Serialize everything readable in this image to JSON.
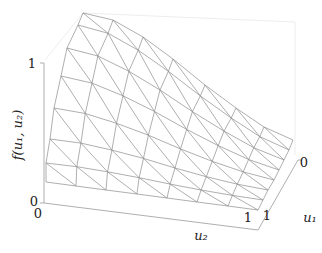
{
  "chart_data": {
    "type": "surface3d",
    "title": "",
    "zlabel": "f(u1, u2)",
    "xlabel": "u2",
    "ylabel": "u1",
    "z_ticks": [
      "0",
      "1"
    ],
    "u2_ticks": [
      "0",
      "1"
    ],
    "u1_ticks": [
      "0",
      "1"
    ],
    "zlim": [
      0,
      1
    ],
    "u1_range": [
      0,
      1
    ],
    "u2_range": [
      0,
      1
    ],
    "grid": {
      "rows": 7,
      "cols": 7,
      "triangulated": true,
      "diagonal": "top-left to bottom-right"
    },
    "mesh_color": "#8c8c8c",
    "frame_color": "#e6e6e6",
    "axis_color": "#999999",
    "projection": {
      "top_edge": [
        [
          83,
          13
        ],
        [
          113,
          20
        ],
        [
          143,
          37
        ],
        [
          173,
          59
        ],
        [
          205,
          85
        ],
        [
          236,
          108
        ],
        [
          264,
          127
        ],
        [
          293,
          140
        ]
      ],
      "bottom_edge": [
        [
          46,
          182
        ],
        [
          76,
          186
        ],
        [
          106,
          190
        ],
        [
          137,
          194
        ],
        [
          167,
          198
        ],
        [
          197,
          202
        ],
        [
          228,
          206
        ],
        [
          258,
          210
        ]
      ],
      "left_edge": [
        [
          83,
          13
        ],
        [
          78,
          25
        ],
        [
          67,
          48
        ],
        [
          61,
          76
        ],
        [
          54,
          108
        ],
        [
          50,
          139
        ],
        [
          46,
          163
        ],
        [
          46,
          182
        ]
      ],
      "right_edge": [
        [
          293,
          140
        ],
        [
          289,
          150
        ],
        [
          284,
          160
        ],
        [
          279,
          170
        ],
        [
          274,
          180
        ],
        [
          268,
          190
        ],
        [
          263,
          200
        ],
        [
          258,
          210
        ]
      ]
    }
  },
  "labels": {
    "z_axis": "f(u₁, u₂)",
    "z_tick_top": "1",
    "z_tick_bottom": "0",
    "u2_tick_left": "0",
    "u2_tick_right": "1",
    "u1_tick_back": "0",
    "u1_tick_front": "1",
    "u2_axis": "u₂",
    "u1_axis": "u₁"
  }
}
